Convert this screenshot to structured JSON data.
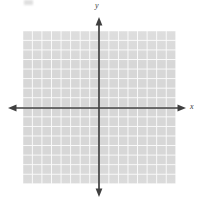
{
  "figure": {
    "name": "cartesian-coordinate-plane",
    "background_color": "#ffffff"
  },
  "grid": {
    "cell_color": "#d7d7d7",
    "line_color": "#fafafa",
    "columns": 16,
    "rows": 16,
    "cell_size_px": 9.5625,
    "left_px": 23,
    "top_px": 31,
    "width_px": 153,
    "height_px": 153
  },
  "axes": {
    "color": "#404040",
    "origin_x_px": 99,
    "origin_y_px": 108,
    "x_axis": {
      "label": "x",
      "start_px": 8,
      "end_px": 186,
      "arrow_start": true,
      "arrow_end": true
    },
    "y_axis": {
      "label": "y",
      "start_px": 17,
      "end_px": 197,
      "arrow_start": true,
      "arrow_end": true
    }
  },
  "labels": {
    "x": "x",
    "y": "y"
  }
}
